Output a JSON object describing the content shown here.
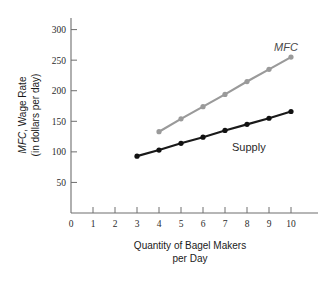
{
  "chart_data": {
    "type": "line",
    "title": "",
    "xlabel": "Quantity of Bagel Makers per Day",
    "xlabel_line1": "Quantity of Bagel Makers",
    "xlabel_line2": "per Day",
    "ylabel": "MFC, Wage Rate (in dollars per day)",
    "ylabel_line1_italic": "MFC",
    "ylabel_line1_rest": ", Wage Rate",
    "ylabel_line2": "(in dollars per day)",
    "xlim": [
      0,
      10
    ],
    "ylim": [
      0,
      300
    ],
    "xticks": [
      0,
      1,
      2,
      3,
      4,
      5,
      6,
      7,
      8,
      9,
      10
    ],
    "xtick_labels": [
      "0",
      "1",
      "2",
      "3",
      "4",
      "5",
      "6",
      "7",
      "8",
      "9",
      "10"
    ],
    "yticks": [
      50,
      100,
      150,
      200,
      250,
      300
    ],
    "ytick_labels": [
      "50",
      "100",
      "150",
      "200",
      "250",
      "300"
    ],
    "grid": false,
    "legend_position": "inline-annotation",
    "series": [
      {
        "name": "MFC",
        "label": "MFC",
        "label_style": "italic",
        "color": "#9a9a9a",
        "marker": "circle",
        "x": [
          4,
          5,
          6,
          7,
          8,
          9,
          10
        ],
        "values": [
          133,
          154,
          174,
          194,
          215,
          235,
          255
        ]
      },
      {
        "name": "Supply",
        "label": "Supply",
        "label_style": "normal",
        "color": "#1a1a1a",
        "marker": "circle",
        "x": [
          3,
          4,
          5,
          6,
          7,
          8,
          9,
          10
        ],
        "values": [
          93,
          103,
          114,
          124,
          135,
          145,
          155,
          166
        ]
      }
    ],
    "annotations": [
      {
        "text": "MFC",
        "x": 9.1,
        "y": 277,
        "style": "italic"
      },
      {
        "text": "Supply",
        "x": 8.5,
        "y": 128,
        "style": "normal"
      }
    ]
  },
  "figure": {
    "background_color": "#ffffff",
    "axis_color": "#6e6e6e",
    "mfc_color": "#9a9a9a",
    "supply_color": "#1a1a1a"
  }
}
